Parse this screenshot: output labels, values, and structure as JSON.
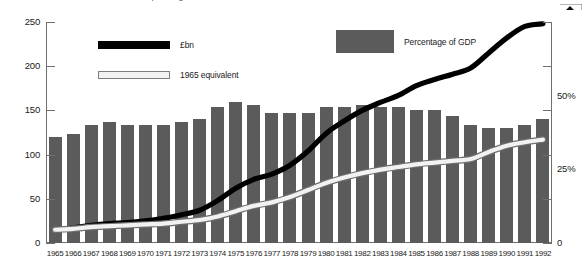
{
  "title": "Public spending 1965-1992",
  "legend": {
    "gdp_label": "Percentage of GDP",
    "gbp_label": "£bn",
    "equiv_label": "1965 equivalent"
  },
  "axes": {
    "left_ticks": [
      "0",
      "50",
      "100",
      "150",
      "200",
      "250"
    ],
    "right_ticks": [
      "0",
      "25%",
      "50%"
    ]
  },
  "chart_data": {
    "type": "bar",
    "title": "Public spending 1965-1992",
    "xlabel": "",
    "ylabel": "£bn",
    "ylim": [
      0,
      250
    ],
    "y2label": "Percentage of GDP",
    "y2lim": [
      0,
      75
    ],
    "grid": false,
    "legend_position": "top",
    "categories": [
      "1965",
      "1966",
      "1967",
      "1968",
      "1969",
      "1970",
      "1971",
      "1972",
      "1973",
      "1974",
      "1975",
      "1976",
      "1977",
      "1978",
      "1979",
      "1980",
      "1981",
      "1982",
      "1983",
      "1984",
      "1985",
      "1986",
      "1987",
      "1988",
      "1989",
      "1990",
      "1991",
      "1992"
    ],
    "series": [
      {
        "name": "Percentage of GDP",
        "type": "bar",
        "axis": "right",
        "unit": "%",
        "color": "#5b5b5b",
        "values": [
          36,
          37,
          40,
          41,
          40,
          40,
          40,
          41,
          42,
          46,
          48,
          47,
          44,
          44,
          44,
          46,
          46,
          47,
          46,
          46,
          45,
          45,
          43,
          40,
          39,
          39,
          40,
          42
        ]
      },
      {
        "name": "£bn",
        "type": "line",
        "axis": "left",
        "unit": "£bn",
        "color": "#000000",
        "values": [
          15,
          17,
          20,
          22,
          23,
          25,
          28,
          32,
          37,
          48,
          62,
          72,
          78,
          88,
          104,
          124,
          138,
          150,
          159,
          167,
          178,
          185,
          191,
          198,
          215,
          232,
          245,
          248
        ]
      },
      {
        "name": "1965 equivalent",
        "type": "line",
        "axis": "left",
        "unit": "£bn",
        "color": "#f2f2f2",
        "values": [
          15,
          16,
          18,
          19,
          20,
          21,
          22,
          24,
          26,
          30,
          36,
          42,
          46,
          52,
          60,
          68,
          74,
          79,
          83,
          86,
          89,
          91,
          93,
          95,
          103,
          110,
          114,
          117
        ]
      }
    ]
  }
}
